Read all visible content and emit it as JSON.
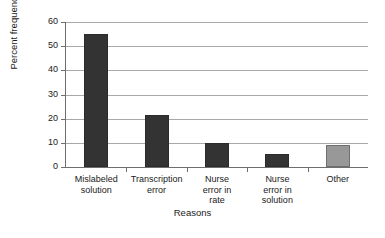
{
  "chart_data": {
    "type": "bar",
    "title": "",
    "xlabel": "Reasons",
    "ylabel": "Percent frequency",
    "categories": [
      "Mislabeled solution",
      "Transcription error",
      "Nurse error in rate",
      "Nurse error in solution",
      "Other"
    ],
    "category_lines": [
      [
        "Mislabeled",
        "solution"
      ],
      [
        "Transcription",
        "error"
      ],
      [
        "Nurse",
        "error in",
        "rate"
      ],
      [
        "Nurse",
        "error in",
        "solution"
      ],
      [
        "Other"
      ]
    ],
    "values": [
      55,
      21.5,
      10,
      5.5,
      9
    ],
    "bar_colors": [
      "#333333",
      "#333333",
      "#333333",
      "#333333",
      "#989898"
    ],
    "ylim": [
      0,
      60
    ],
    "yticks": [
      0,
      10,
      20,
      30,
      40,
      50,
      60
    ],
    "ytick_labels": [
      "0",
      "10",
      "20",
      "30",
      "40",
      "50",
      "60"
    ],
    "grid": "horizontal",
    "gridline_color": "#a8a8a8",
    "axis_color": "#6e6e6e",
    "legend": "none",
    "background": "#ffffff"
  }
}
